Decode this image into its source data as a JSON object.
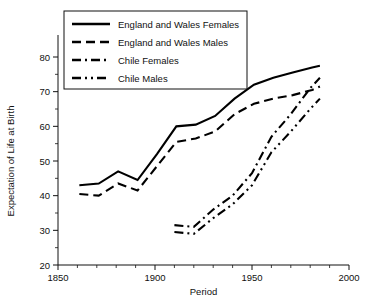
{
  "chart_data": {
    "type": "line",
    "title": "",
    "xlabel": "Period",
    "ylabel": "Expectation of Life at Birth",
    "xlim": [
      1850,
      2000
    ],
    "ylim": [
      20,
      80
    ],
    "xticks": [
      1850,
      1900,
      1950,
      2000
    ],
    "xtick_labels": [
      "1850",
      "1900",
      "1950",
      "2000"
    ],
    "yticks": [
      20,
      30,
      40,
      50,
      60,
      70,
      80
    ],
    "ytick_labels": [
      "20",
      "30",
      "40",
      "50",
      "60",
      "70",
      "80"
    ],
    "x_minor_step": 10,
    "y_minor_step": 5,
    "grid": false,
    "legend_position": "top-left",
    "series": [
      {
        "name": "England and Wales Females",
        "dash": "solid",
        "x": [
          1861,
          1871,
          1881,
          1891,
          1901,
          1911,
          1921,
          1931,
          1941,
          1951,
          1961,
          1971,
          1981,
          1985
        ],
        "values": [
          43.0,
          43.5,
          47.0,
          44.5,
          52.0,
          60.0,
          60.5,
          63.0,
          68.0,
          72.0,
          74.0,
          75.5,
          77.0,
          77.5
        ]
      },
      {
        "name": "England and Wales Males",
        "dash": "dashed",
        "x": [
          1861,
          1871,
          1881,
          1891,
          1901,
          1911,
          1921,
          1931,
          1941,
          1951,
          1961,
          1971,
          1981,
          1985
        ],
        "values": [
          40.5,
          40.0,
          43.5,
          41.5,
          48.5,
          55.5,
          56.5,
          58.5,
          63.5,
          66.5,
          68.0,
          69.0,
          70.5,
          71.5
        ]
      },
      {
        "name": "Chile Females",
        "dash": "dashdot",
        "x": [
          1910,
          1920,
          1930,
          1940,
          1950,
          1960,
          1970,
          1980,
          1985
        ],
        "values": [
          31.5,
          31.0,
          36.0,
          40.0,
          46.5,
          57.0,
          63.5,
          71.0,
          74.0
        ]
      },
      {
        "name": "Chile Males",
        "dash": "dashdotdot",
        "x": [
          1910,
          1920,
          1930,
          1940,
          1950,
          1960,
          1970,
          1980,
          1985
        ],
        "values": [
          29.5,
          29.0,
          33.5,
          37.5,
          43.0,
          52.5,
          58.5,
          65.0,
          68.0
        ]
      }
    ]
  },
  "legend": {
    "entries": [
      {
        "label": "England and Wales Females"
      },
      {
        "label": "England and Wales Males"
      },
      {
        "label": "Chile Females"
      },
      {
        "label": "Chile Males"
      }
    ]
  },
  "colors": {
    "ink": "#111111",
    "series": "#000000",
    "background": "#ffffff"
  }
}
